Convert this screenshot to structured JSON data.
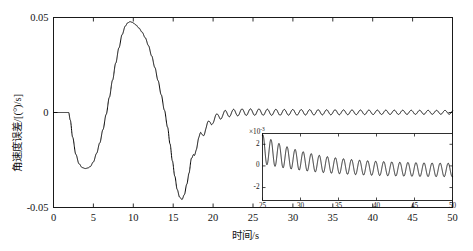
{
  "figure": {
    "background_color": "#ffffff",
    "line_color": "#000000"
  },
  "chart_data": {
    "type": "line",
    "title": "",
    "xlabel": "时间/s",
    "ylabel": "角速度误差/[(°)/s]",
    "xlim": [
      0,
      50
    ],
    "ylim": [
      -0.05,
      0.05
    ],
    "xticks": [
      0,
      5,
      10,
      15,
      20,
      25,
      30,
      35,
      40,
      45,
      50
    ],
    "xticklabels": [
      "0",
      "5",
      "10",
      "15",
      "20",
      "25",
      "30",
      "35",
      "40",
      "45",
      "50"
    ],
    "yticks": [
      -0.05,
      0,
      0.05
    ],
    "yticklabels": [
      "-0.05",
      "0",
      "0.05"
    ],
    "grid": false,
    "legend": null,
    "series": [
      {
        "name": "角速度误差",
        "x": [
          0,
          0.5,
          1.0,
          1.5,
          1.9,
          2.1,
          2.4,
          2.8,
          3.2,
          3.6,
          4.0,
          4.3,
          4.6,
          5.0,
          5.4,
          5.8,
          6.2,
          6.6,
          7.0,
          7.4,
          7.8,
          8.2,
          8.6,
          9.0,
          9.3,
          9.6,
          9.9,
          10.3,
          10.7,
          11.1,
          11.5,
          11.9,
          12.3,
          12.7,
          13.1,
          13.5,
          13.9,
          14.3,
          14.6,
          14.9,
          15.2,
          15.5,
          15.8,
          16.1,
          16.4,
          16.7,
          17.0,
          17.3,
          17.6,
          17.9,
          18.2,
          18.5,
          18.8,
          19.1,
          19.4,
          19.7,
          20.0,
          20.4,
          20.8,
          21.2,
          21.6,
          22.0,
          22.4,
          22.8,
          23.2,
          23.6,
          24.0,
          24.5,
          25.0,
          26.0,
          27.0,
          28.0,
          30.0,
          32.0,
          34.0,
          36.0,
          38.0,
          40.0,
          42.0,
          44.0,
          46.0,
          48.0,
          50.0
        ],
        "y": [
          0,
          0,
          0,
          0,
          0,
          -0.004,
          -0.013,
          -0.022,
          -0.027,
          -0.029,
          -0.0295,
          -0.0292,
          -0.0285,
          -0.026,
          -0.0215,
          -0.016,
          -0.009,
          -0.001,
          0.008,
          0.017,
          0.026,
          0.034,
          0.041,
          0.0455,
          0.0472,
          0.0478,
          0.0474,
          0.0462,
          0.0445,
          0.0423,
          0.0393,
          0.0352,
          0.0298,
          0.0237,
          0.0168,
          0.0093,
          0.0012,
          -0.0078,
          -0.0165,
          -0.0255,
          -0.0335,
          -0.0405,
          -0.0445,
          -0.0458,
          -0.0432,
          -0.0378,
          -0.0318,
          -0.0262,
          -0.0215,
          -0.0178,
          -0.0148,
          -0.0118,
          -0.0102,
          -0.0082,
          -0.0066,
          -0.0052,
          -0.0038,
          -0.0028,
          -0.0018,
          -0.0012,
          -0.0007,
          -0.0004,
          -0.0002,
          -0.0001,
          5e-05,
          0.0001,
          0.0002,
          0.0002,
          0.0002,
          0.0002,
          0.0001,
          0.0001,
          0.0001,
          0.0001,
          0.0001,
          0.0001,
          0.0001,
          0.0001,
          0.0001,
          0.0001,
          0.0001,
          0.0001,
          0.0001
        ],
        "ripple": {
          "start_x": 17.0,
          "amplitude": 0.0022,
          "period": 1.06,
          "decay": 0.055
        }
      }
    ]
  },
  "inset_chart_data": {
    "type": "line",
    "title": "",
    "xlabel": "",
    "ylabel": "",
    "y_exponent_label": "×10",
    "y_exponent_power": "-3",
    "xlim": [
      25,
      50
    ],
    "ylim": [
      -3.2,
      3.0
    ],
    "xticks": [
      25,
      30,
      35,
      40,
      45,
      50
    ],
    "xticklabels": [
      "25",
      "30",
      "35",
      "40",
      "45",
      "50"
    ],
    "yticks": [
      -2,
      0,
      2
    ],
    "yticklabels": [
      "-2",
      "0",
      "2"
    ],
    "grid": false,
    "series": [
      {
        "name": "角速度误差(放大)",
        "mean_start": 1.55,
        "mean_end": -0.42,
        "mean_decay": 0.155,
        "amplitude_start": 1.35,
        "amplitude_end": 0.62,
        "amplitude_decay": 0.2,
        "period": 1.06,
        "phase": 1.25
      }
    ]
  }
}
